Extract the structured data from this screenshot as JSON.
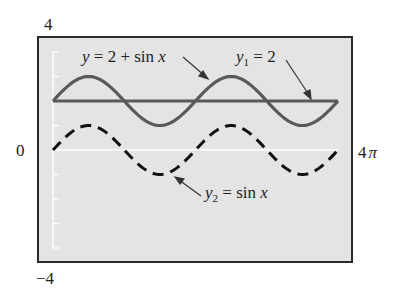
{
  "chart_data": {
    "type": "line",
    "title": "",
    "xlabel": "",
    "ylabel": "",
    "xlim": [
      0,
      12.566
    ],
    "ylim": [
      -4,
      4
    ],
    "x_tick_labels": [
      "0",
      "4π"
    ],
    "y_tick_labels": [
      "4",
      "0",
      "-4"
    ],
    "grid": false,
    "legend": null,
    "series": [
      {
        "name": "y = 2 + sin x",
        "style": "solid",
        "color": "#5a5a5a",
        "function": "2 + sin(x)",
        "x": [
          0,
          1.571,
          3.142,
          4.712,
          6.283,
          7.854,
          9.425,
          10.996,
          12.566
        ],
        "values": [
          2,
          3,
          2,
          1,
          2,
          3,
          2,
          1,
          2
        ]
      },
      {
        "name": "y1 = 2",
        "style": "solid",
        "color": "#5a5a5a",
        "function": "2",
        "x": [
          0,
          12.566
        ],
        "values": [
          2,
          2
        ]
      },
      {
        "name": "y2 = sin x",
        "style": "dashed",
        "color": "#111111",
        "function": "sin(x)",
        "x": [
          0,
          1.571,
          3.142,
          4.712,
          6.283,
          7.854,
          9.425,
          10.996,
          12.566
        ],
        "values": [
          0,
          1,
          0,
          -1,
          0,
          1,
          0,
          -1,
          0
        ]
      }
    ],
    "annotations": [
      {
        "text": "y = 2 + sin x",
        "points_to": "y = 2 + sin x"
      },
      {
        "text": "y1 = 2",
        "points_to": "y1 = 2"
      },
      {
        "text": "y2 = sin x",
        "points_to": "y2 = sin x"
      }
    ]
  },
  "labels": {
    "y_top": "4",
    "y_zero": "0",
    "y_bottom": "−4",
    "x_right_num": "4",
    "x_right_pi": "π",
    "ann1_y": "y",
    "ann1_rest": " = 2 + sin ",
    "ann1_x": "x",
    "ann2_y": "y",
    "ann2_sub": "1",
    "ann2_rest": " = 2",
    "ann3_y": "y",
    "ann3_sub": "2",
    "ann3_rest": " = sin ",
    "ann3_x": "x"
  },
  "colors": {
    "plot_bg": "#e4e4e4",
    "frame": "#2a2a2a",
    "curve_solid": "#5a5a5a",
    "curve_dashed": "#111111",
    "axis_line": "#ffffff"
  }
}
